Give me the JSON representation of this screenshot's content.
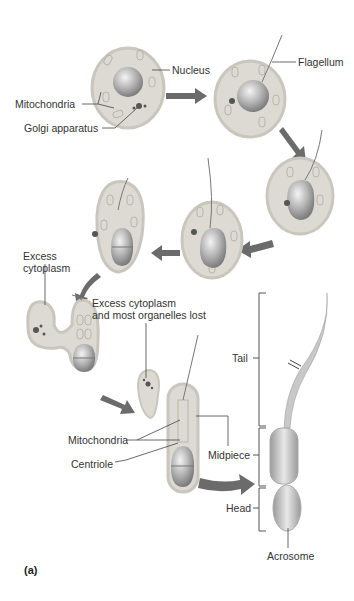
{
  "figure": {
    "panel_label": "(a)"
  },
  "labels": {
    "nucleus": "Nucleus",
    "mitochondria_top": "Mitochondria",
    "golgi": "Golgi apparatus",
    "flagellum": "Flagellum",
    "excess_cytoplasm_1": "Excess",
    "excess_cytoplasm_2": "cytoplasm",
    "lost_1": "Excess cytoplasm",
    "lost_2": "and most organelles lost",
    "mitochondria_bottom": "Mitochondria",
    "centriole": "Centriole",
    "midpiece": "Midpiece",
    "tail": "Tail",
    "head": "Head",
    "acrosome": "Acrosome"
  },
  "colors": {
    "cytoplasm": "#dcdad2",
    "membrane": "#c9c6bd",
    "nucleus": "#a9a9a9",
    "arrow": "#6b6b6b",
    "line": "#444444"
  }
}
